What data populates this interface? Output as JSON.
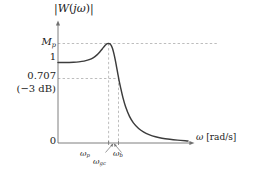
{
  "chart_data": {
    "type": "line",
    "title": "|W(jω)|",
    "xlabel": "ω [rad/s]",
    "ylabel": "|W(jω)|",
    "grid": false,
    "legend": null,
    "x_ticks": [
      "ω_p",
      "ω_gc",
      "ω_b"
    ],
    "y_ticks": [
      "M_p",
      "1",
      "0.707",
      "(−3 dB)",
      "0"
    ],
    "annotations": [
      "M_p is the resonant peak magnitude",
      "0.707 corresponds to −3 dB",
      "ω_p is the resonant peak frequency",
      "ω_gc is the gain crossover frequency",
      "ω_b is the bandwidth frequency"
    ],
    "xlim": [
      0,
      1
    ],
    "ylim": [
      0,
      1.32
    ],
    "series": [
      {
        "name": "|W(jω)|",
        "x": [
          0.0,
          0.04,
          0.08,
          0.12,
          0.16,
          0.2,
          0.24,
          0.27,
          0.3,
          0.32,
          0.34,
          0.36,
          0.37,
          0.38,
          0.39,
          0.4,
          0.405,
          0.41,
          0.415,
          0.42,
          0.43,
          0.44,
          0.45,
          0.46,
          0.47,
          0.48,
          0.5,
          0.52,
          0.55,
          0.58,
          0.62,
          0.66,
          0.7,
          0.75,
          0.8,
          0.86,
          0.92,
          1.0
        ],
        "y": [
          1.0,
          1.0,
          1.001,
          1.003,
          1.008,
          1.017,
          1.035,
          1.058,
          1.095,
          1.128,
          1.168,
          1.208,
          1.224,
          1.234,
          1.236,
          1.23,
          1.222,
          1.21,
          1.192,
          1.17,
          1.11,
          1.035,
          0.95,
          0.862,
          0.775,
          0.7,
          0.56,
          0.45,
          0.33,
          0.25,
          0.18,
          0.135,
          0.105,
          0.078,
          0.06,
          0.046,
          0.036,
          0.026
        ]
      }
    ],
    "markers": {
      "omega_p": {
        "x": 0.39,
        "y": 1.236,
        "label": "ω_p"
      },
      "omega_gc": {
        "x": 0.43,
        "y": 1.0,
        "label": "ω_gc"
      },
      "omega_b": {
        "x": 0.478,
        "y": 0.707,
        "label": "ω_b"
      }
    },
    "guides": {
      "h_mp": 1.236,
      "h_one": 1.0,
      "h_707": 0.707,
      "v_wp": 0.39,
      "v_wb": 0.478
    },
    "colors": {
      "curve": "#3c3c3c",
      "axis": "#6b6b6b",
      "guide": "#9a9a9a",
      "text": "#1a1a1a",
      "background": "#ffffff"
    }
  },
  "labels": {
    "y_axis_title_prefix": "|",
    "y_axis_title": "|W(jω)|",
    "mp": "M",
    "mp_sub": "p",
    "one": "1",
    "v707": "0.707",
    "db": "(−3 dB)",
    "zero": "0",
    "wp": "ω",
    "wp_sub": "p",
    "wgc": "ω",
    "wgc_sub": "gc",
    "wb": "ω",
    "wb_sub": "b",
    "x_axis_omega": "ω",
    "x_axis_units": "[rad/s]"
  }
}
